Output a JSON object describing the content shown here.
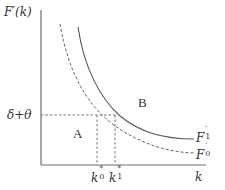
{
  "diagram": {
    "y_axis_label": "F′(k)",
    "x_axis_label": "k",
    "hline_label": "δ+θ",
    "region_a_label": "A",
    "region_b_label": "B",
    "curve_f1": {
      "label_main": "F",
      "label_prime": "′",
      "label_sub": "1",
      "style": "solid"
    },
    "curve_f0": {
      "label_main": "F",
      "label_prime": "′",
      "label_sub": "0",
      "style": "dashed"
    },
    "k0_label": {
      "main": "k",
      "sub": "0",
      "sup": "*"
    },
    "k1_label": {
      "main": "k",
      "sub": "1",
      "sup": "*"
    },
    "colors": {
      "axis": "#6e6e6e",
      "curve": "#555555",
      "dashed": "#777777",
      "text": "#333333"
    }
  }
}
